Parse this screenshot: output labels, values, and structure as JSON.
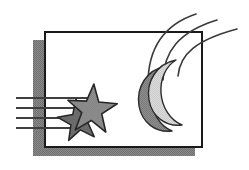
{
  "artwork": {
    "title": "Night Sky Clip Art",
    "description": "Framed rectangle with drop shadow containing two stars with motion lines and a crescent moon with swoosh arcs",
    "canvas": {
      "width": 249,
      "height": 170,
      "background": "#ffffff"
    },
    "colors": {
      "background": "#ffffff",
      "outline": "#262626",
      "frame_fill": "#ffffff",
      "frame_border": "#1a1a1a",
      "shadow_gray": "#7d7d7d",
      "star_gray": "#8c8c8c",
      "star_dark_gray": "#6b6b6b",
      "moon_light": "#d6d6d6",
      "moon_shadow": "#8a8a8a",
      "line_gray": "#3f3f3f"
    },
    "frame": {
      "name": "picture-frame",
      "shadow_rect": {
        "x": 33,
        "y": 40,
        "width": 162,
        "height": 116
      },
      "white_rect": {
        "x": 44,
        "y": 31,
        "width": 159,
        "height": 117
      },
      "border_width": 2
    },
    "speed_lines": {
      "name": "motion-lines",
      "count": 4,
      "stroke_width": 2,
      "lines": [
        {
          "x1": 16,
          "y1": 98,
          "x2": 88,
          "y2": 98
        },
        {
          "x1": 16,
          "y1": 108,
          "x2": 76,
          "y2": 108
        },
        {
          "x1": 16,
          "y1": 118,
          "x2": 70,
          "y2": 118
        },
        {
          "x1": 16,
          "y1": 128,
          "x2": 82,
          "y2": 128
        }
      ]
    },
    "stars": [
      {
        "name": "small-star",
        "cx": 79,
        "cy": 121,
        "outer_radius": 22,
        "inner_radius": 9,
        "rotation": -8,
        "fill": "#6b6b6b"
      },
      {
        "name": "large-star",
        "cx": 92,
        "cy": 110,
        "outer_radius": 26,
        "inner_radius": 10.5,
        "rotation": 4,
        "fill": "#8c8c8c"
      }
    ],
    "moon": {
      "name": "crescent-moon",
      "light_fill": "#d6d6d6",
      "shadow_fill": "#8a8a8a",
      "center_x": 158,
      "center_y": 95
    },
    "swoosh_arcs": {
      "name": "swoosh-arcs",
      "count": 3,
      "stroke_width": 1.6,
      "arcs": [
        {
          "d": "M 148 84 C 148 52 160 26 196 14"
        },
        {
          "d": "M 163 80 C 164 52 178 32 217 20"
        },
        {
          "d": "M 178 76 C 180 54 196 40 237 29"
        }
      ]
    }
  }
}
